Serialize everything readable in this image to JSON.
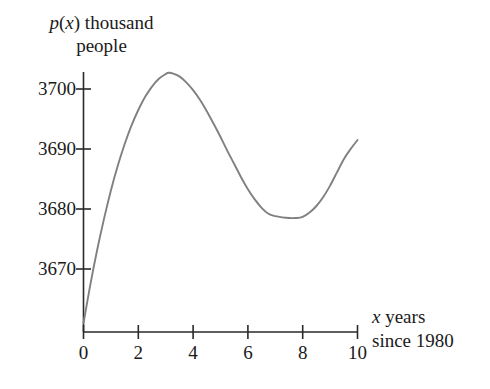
{
  "chart_data": {
    "type": "line",
    "title": "",
    "ylabel_line1": "p(x) thousand",
    "ylabel_line2": "people",
    "xlabel_line1": "x years",
    "xlabel_line2": "since 1980",
    "xlabel": "x years since 1980",
    "ylabel": "p(x) thousand people",
    "grid": false,
    "legend": "none",
    "line_color": "#808080",
    "axis_color": "#2a2a2a",
    "xlim": [
      0,
      10
    ],
    "ylim": [
      3661,
      3704
    ],
    "xticks": [
      0,
      2,
      4,
      6,
      8,
      10
    ],
    "xtick_labels": [
      "0",
      "2",
      "4",
      "6",
      "8",
      "10"
    ],
    "yticks": [
      3670,
      3680,
      3690,
      3700
    ],
    "ytick_labels": [
      "3670",
      "3680",
      "3690",
      "3700"
    ],
    "annotations": [],
    "series": [
      {
        "name": "p(x)",
        "x": [
          0.0,
          0.25,
          0.5,
          0.75,
          1.0,
          1.25,
          1.5,
          1.75,
          2.0,
          2.25,
          2.5,
          2.75,
          3.0,
          3.1,
          3.25,
          3.5,
          3.75,
          4.0,
          4.25,
          4.5,
          4.75,
          5.0,
          5.25,
          5.5,
          5.75,
          6.0,
          6.25,
          6.5,
          6.75,
          7.0,
          7.25,
          7.5,
          7.75,
          8.0,
          8.25,
          8.5,
          8.75,
          9.0,
          9.25,
          9.5,
          9.75,
          10.0
        ],
        "y": [
          3661.0,
          3667.4,
          3673.2,
          3678.4,
          3683.1,
          3687.2,
          3690.8,
          3693.9,
          3696.5,
          3698.7,
          3700.4,
          3701.7,
          3702.5,
          3702.7,
          3702.6,
          3702.1,
          3701.1,
          3699.8,
          3698.2,
          3696.3,
          3694.2,
          3692.0,
          3689.7,
          3687.5,
          3685.3,
          3683.3,
          3681.6,
          3680.2,
          3679.2,
          3678.8,
          3678.6,
          3678.5,
          3678.5,
          3678.7,
          3679.4,
          3680.5,
          3682.0,
          3683.9,
          3686.1,
          3688.3,
          3690.0,
          3691.5
        ]
      }
    ],
    "features": {
      "local_maximum": {
        "x": 3.1,
        "y": 3702.7
      },
      "local_minimum": {
        "x": 8.0,
        "y": 3678.7
      },
      "start_point": {
        "x": 0,
        "y": 3661
      },
      "end_point": {
        "x": 10,
        "y": 3691.5
      }
    }
  }
}
